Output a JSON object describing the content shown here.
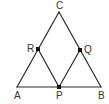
{
  "diagram": {
    "type": "geometry-triangle",
    "stroke_color": "#2a2a2a",
    "point_color": "#111111",
    "label_color": "#333333",
    "points": {
      "A": {
        "label": "A",
        "x": 17,
        "y": 87,
        "lx": 14,
        "ly": 99
      },
      "B": {
        "label": "B",
        "x": 101,
        "y": 87,
        "lx": 98,
        "ly": 99
      },
      "C": {
        "label": "C",
        "x": 59,
        "y": 12,
        "lx": 56,
        "ly": 9
      },
      "P": {
        "label": "P",
        "x": 59,
        "y": 87,
        "lx": 56,
        "ly": 99
      },
      "Q": {
        "label": "Q",
        "x": 80,
        "y": 50,
        "lx": 84,
        "ly": 53
      },
      "R": {
        "label": "R",
        "x": 38,
        "y": 49,
        "lx": 27,
        "ly": 52
      }
    },
    "segments": [
      [
        "A",
        "C"
      ],
      [
        "C",
        "B"
      ],
      [
        "A",
        "B"
      ],
      [
        "R",
        "P"
      ],
      [
        "P",
        "Q"
      ]
    ],
    "marked_points": [
      "R",
      "Q",
      "P"
    ]
  }
}
